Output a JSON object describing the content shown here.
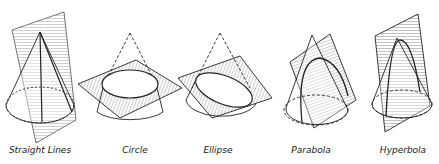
{
  "figure": {
    "panels": [
      {
        "id": "straight-lines",
        "label": "Straight Lines",
        "cx": 40
      },
      {
        "id": "circle",
        "label": "Circle",
        "cx": 135
      },
      {
        "id": "ellipse",
        "label": "Ellipse",
        "cx": 218
      },
      {
        "id": "parabola",
        "label": "Parabola",
        "cx": 311
      },
      {
        "id": "hyperbola",
        "label": "Hyperbola",
        "cx": 403
      }
    ],
    "colors": {
      "ink": "#222222",
      "background": "#ffffff"
    }
  }
}
